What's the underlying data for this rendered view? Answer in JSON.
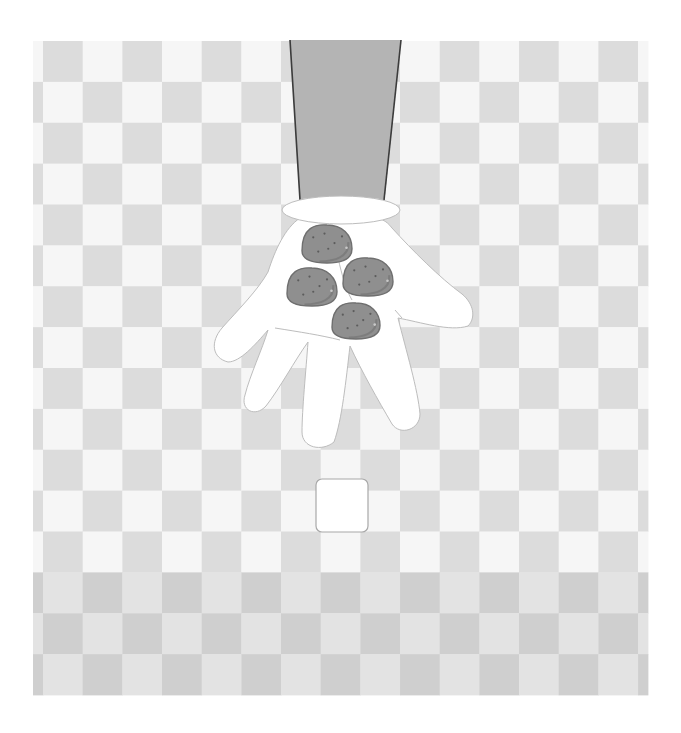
{
  "scene": {
    "description": "Illustration of a gloved hand reaching down from above, holding four potatoes over a gray checkerboard, with a small empty white box below",
    "width": 681,
    "height": 733
  },
  "colors": {
    "background": "#ffffff",
    "checker_light": "#f6f6f6",
    "checker_dark": "#dcdcdc",
    "floor_light": "#e3e3e3",
    "floor_dark": "#cfcfcf",
    "sleeve": "#b4b4b4",
    "sleeve_outline": "#3c3c3c",
    "glove": "#ffffff",
    "glove_outline": "#bdbdbd",
    "potato": "#8f8f8f",
    "potato_outline": "#6f6f6f",
    "potato_speck": "#5c5c5c",
    "potato_highlight": "#c9c9c9",
    "box_fill": "#ffffff",
    "box_outline": "#a8a8a8"
  },
  "board": {
    "x": 33,
    "y": 41,
    "right": 648,
    "bottom": 695,
    "first_col_x": 43,
    "col_width": 39.67,
    "row_height": 40.875,
    "rows": 16,
    "floor_start_row": 13
  },
  "objects": {
    "arm_label": "Sleeve / arm",
    "hand_label": "White glove hand",
    "potatoes": [
      {
        "label": "Potato 1",
        "cx": 327,
        "cy": 244,
        "rx": 25,
        "ry": 19
      },
      {
        "label": "Potato 2",
        "cx": 312,
        "cy": 287,
        "rx": 25,
        "ry": 19
      },
      {
        "label": "Potato 3",
        "cx": 368,
        "cy": 277,
        "rx": 25,
        "ry": 19
      },
      {
        "label": "Potato 4",
        "cx": 356,
        "cy": 321,
        "rx": 24,
        "ry": 18
      }
    ],
    "box_label": "Empty white box",
    "box": {
      "x": 316,
      "y": 479,
      "w": 52,
      "h": 53,
      "r": 6
    }
  }
}
